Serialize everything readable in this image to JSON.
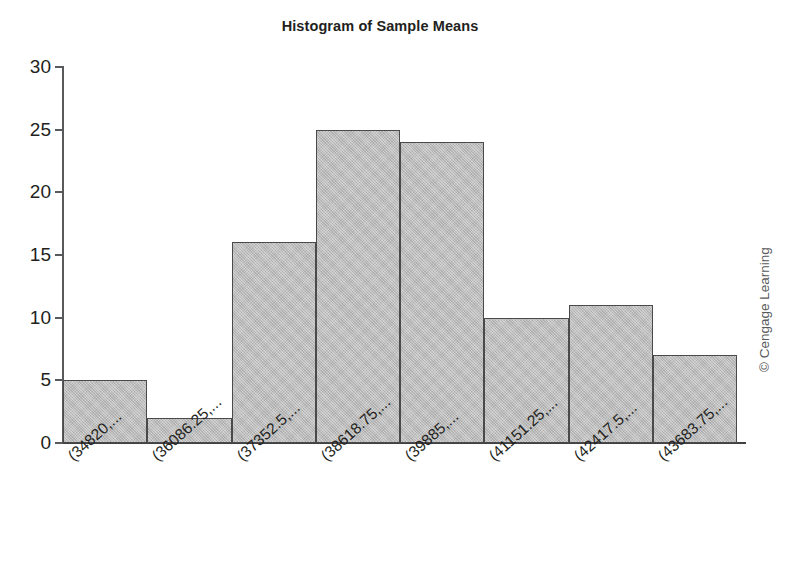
{
  "chart_data": {
    "type": "bar",
    "title": "Histogram of Sample Means",
    "xlabel": "",
    "ylabel": "",
    "ylim": [
      0,
      30
    ],
    "yticks": [
      0,
      5,
      10,
      15,
      20,
      25,
      30
    ],
    "grid": false,
    "legend": "none",
    "bar_gap": 0,
    "categories": [
      "(34820,...",
      "(36086.25,...",
      "(37352.5,...",
      "(38618.75,...",
      "(39885,...",
      "(41151.25,...",
      "(42417.5,...",
      "(43683.75,..."
    ],
    "values": [
      5,
      2,
      16,
      25,
      24,
      10,
      11,
      7
    ],
    "colors": {
      "bar_fill": "#bcbcbc",
      "bar_border": "#4a4a4c",
      "axis": "#58595b",
      "text": "#231f20",
      "background": "#ffffff"
    }
  },
  "credit": {
    "text": "© Cengage Learning"
  }
}
